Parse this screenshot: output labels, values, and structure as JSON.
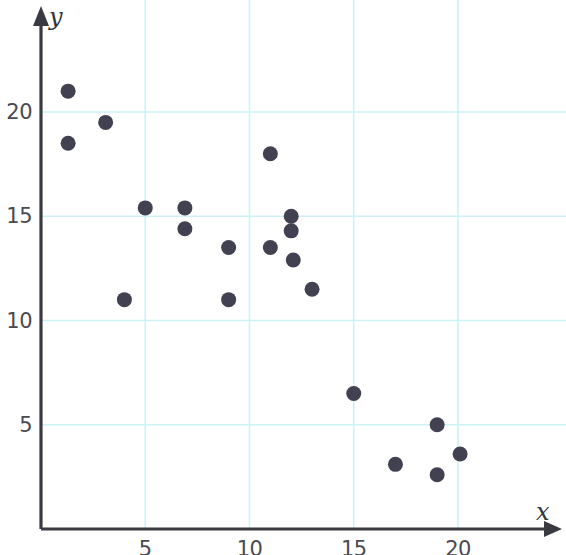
{
  "chart_data": {
    "type": "scatter",
    "title": "",
    "xlabel": "x",
    "ylabel": "y",
    "xlim": [
      0,
      25.2
    ],
    "ylim": [
      0,
      25.4
    ],
    "xticks": [
      5,
      10,
      15,
      20
    ],
    "yticks": [
      5,
      10,
      15,
      20
    ],
    "xtick_labels": [
      "5",
      "10",
      "15",
      "20"
    ],
    "ytick_labels": [
      "5",
      "10",
      "15",
      "20"
    ],
    "grid": true,
    "grid_color": "#ccf2f7",
    "axis_color": "#3a3a42",
    "point_color": "#414152",
    "point_radius": 7.5,
    "legend": null,
    "annotations": [],
    "points": [
      {
        "x": 1.3,
        "y": 21.0
      },
      {
        "x": 1.3,
        "y": 18.5
      },
      {
        "x": 3.1,
        "y": 19.5
      },
      {
        "x": 4.0,
        "y": 11.0
      },
      {
        "x": 5.0,
        "y": 15.4
      },
      {
        "x": 6.9,
        "y": 15.4
      },
      {
        "x": 6.9,
        "y": 14.4
      },
      {
        "x": 9.0,
        "y": 13.5
      },
      {
        "x": 9.0,
        "y": 11.0
      },
      {
        "x": 11.0,
        "y": 18.0
      },
      {
        "x": 11.0,
        "y": 13.5
      },
      {
        "x": 12.0,
        "y": 15.0
      },
      {
        "x": 12.0,
        "y": 14.3
      },
      {
        "x": 12.1,
        "y": 12.9
      },
      {
        "x": 13.0,
        "y": 11.5
      },
      {
        "x": 15.0,
        "y": 6.5
      },
      {
        "x": 17.0,
        "y": 3.1
      },
      {
        "x": 19.0,
        "y": 5.0
      },
      {
        "x": 19.0,
        "y": 2.6
      },
      {
        "x": 20.1,
        "y": 3.6
      }
    ]
  }
}
